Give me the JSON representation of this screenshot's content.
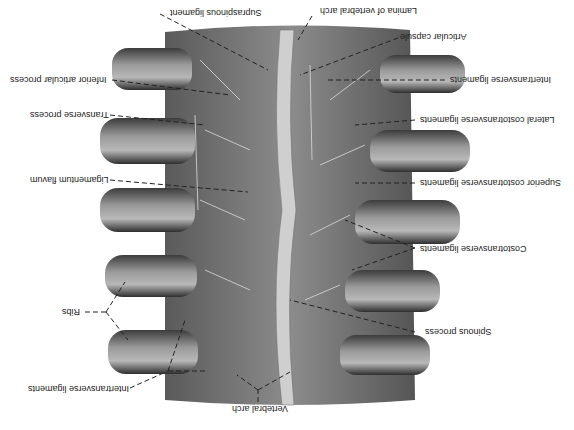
{
  "figure": {
    "orientation": "rotated-180",
    "labels": [
      {
        "id": "supraspinous",
        "text": "Supraspinous ligament",
        "x": 170,
        "y": 12
      },
      {
        "id": "lamina",
        "text": "Lamina of vertebral arch",
        "x": 345,
        "y": 11
      },
      {
        "id": "articular-capsule",
        "text": "Articular capsule",
        "x": 400,
        "y": 36
      },
      {
        "id": "inferior-articular",
        "text": "Inferior articular process",
        "x": 38,
        "y": 77
      },
      {
        "id": "intertransverse-top",
        "text": "Intertransverse ligaments",
        "x": 450,
        "y": 78
      },
      {
        "id": "transverse",
        "text": "Transverse process",
        "x": 60,
        "y": 113
      },
      {
        "id": "lateral-costotransverse",
        "text": "Lateral costotransverse ligaments",
        "x": 420,
        "y": 118
      },
      {
        "id": "ligamentum-flavum",
        "text": "Ligamentum flavum",
        "x": 70,
        "y": 178
      },
      {
        "id": "superior-costotransverse",
        "text": "Superior costotransverse ligaments",
        "x": 420,
        "y": 182
      },
      {
        "id": "costotransverse",
        "text": "Costotransverse ligaments",
        "x": 430,
        "y": 250
      },
      {
        "id": "ribs",
        "text": "Ribs",
        "x": 70,
        "y": 308
      },
      {
        "id": "spinous",
        "text": "Spinous process",
        "x": 430,
        "y": 330
      },
      {
        "id": "intertransverse-bottom",
        "text": "Intertransverse ligaments",
        "x": 34,
        "y": 385
      },
      {
        "id": "vertebral-arch",
        "text": "Vertebral arch",
        "x": 225,
        "y": 406
      }
    ]
  },
  "colors": {
    "bone": "#8a8a8a",
    "bone_dark": "#4a4a4a",
    "bone_light": "#c8c8c8",
    "ligament": "#d8d8d8",
    "text": "#222222",
    "leader": "#222222"
  }
}
